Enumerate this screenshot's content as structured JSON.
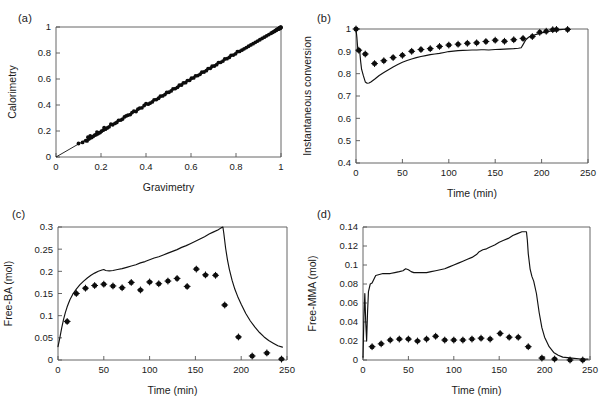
{
  "figure": {
    "background": "#ffffff",
    "line_color": "#111111",
    "marker_color": "#0d0d0d",
    "axis_color": "#555555"
  },
  "panels": {
    "a": {
      "label": "(a)"
    },
    "b": {
      "label": "(b)"
    },
    "c": {
      "label": "(c)"
    },
    "d": {
      "label": "(d)"
    }
  },
  "chart_data": [
    {
      "id": "panel-a",
      "type": "scatter",
      "title": "(a)",
      "xlabel": "Gravimetry",
      "ylabel": "Calorimetry",
      "xlim": [
        0,
        1
      ],
      "ylim": [
        0,
        1
      ],
      "xticks": [
        0,
        0.2,
        0.4,
        0.6,
        0.8,
        1
      ],
      "xticklabels": [
        "0",
        "0.2",
        "0.4",
        "0.6",
        "0.8",
        "1"
      ],
      "yticks": [
        0,
        0.2,
        0.4,
        0.6,
        0.8,
        1
      ],
      "yticklabels": [
        "0",
        "0.2",
        "0.4",
        "0.6",
        "0.8",
        "1"
      ],
      "grid": false,
      "legend": "none",
      "series": [
        {
          "name": "identity line",
          "type": "line",
          "x": [
            0,
            1
          ],
          "y": [
            0,
            1
          ]
        },
        {
          "name": "calorimetry vs gravimetry",
          "type": "scatter",
          "x": [
            0.1,
            0.118,
            0.132,
            0.138,
            0.142,
            0.146,
            0.15,
            0.152,
            0.158,
            0.165,
            0.172,
            0.178,
            0.182,
            0.186,
            0.19,
            0.196,
            0.202,
            0.21,
            0.214,
            0.22,
            0.228,
            0.236,
            0.244,
            0.252,
            0.262,
            0.27,
            0.278,
            0.288,
            0.296,
            0.304,
            0.312,
            0.32,
            0.33,
            0.338,
            0.346,
            0.356,
            0.364,
            0.372,
            0.382,
            0.392,
            0.4,
            0.41,
            0.418,
            0.428,
            0.436,
            0.446,
            0.456,
            0.464,
            0.474,
            0.484,
            0.492,
            0.502,
            0.512,
            0.52,
            0.53,
            0.54,
            0.548,
            0.558,
            0.566,
            0.576,
            0.584,
            0.594,
            0.602,
            0.612,
            0.62,
            0.63,
            0.64,
            0.648,
            0.658,
            0.668,
            0.676,
            0.686,
            0.694,
            0.704,
            0.714,
            0.722,
            0.732,
            0.742,
            0.75,
            0.76,
            0.77,
            0.778,
            0.788,
            0.798,
            0.806,
            0.816,
            0.826,
            0.836,
            0.846,
            0.856,
            0.866,
            0.876,
            0.886,
            0.896,
            0.906,
            0.916,
            0.926,
            0.936,
            0.946,
            0.956,
            0.962,
            0.968,
            0.972,
            0.976,
            0.98,
            0.982,
            0.984,
            0.986,
            0.988,
            0.99,
            0.991,
            0.992,
            0.993,
            0.994,
            0.995,
            0.996,
            0.997,
            0.998,
            0.999,
            1.0
          ],
          "y": [
            0.104,
            0.112,
            0.126,
            0.124,
            0.152,
            0.138,
            0.146,
            0.162,
            0.15,
            0.158,
            0.168,
            0.172,
            0.192,
            0.178,
            0.186,
            0.188,
            0.198,
            0.206,
            0.226,
            0.214,
            0.224,
            0.232,
            0.252,
            0.248,
            0.258,
            0.266,
            0.282,
            0.284,
            0.292,
            0.308,
            0.316,
            0.322,
            0.326,
            0.342,
            0.352,
            0.35,
            0.368,
            0.376,
            0.378,
            0.396,
            0.41,
            0.406,
            0.414,
            0.424,
            0.44,
            0.442,
            0.452,
            0.468,
            0.47,
            0.48,
            0.496,
            0.498,
            0.508,
            0.524,
            0.526,
            0.536,
            0.552,
            0.554,
            0.57,
            0.572,
            0.588,
            0.59,
            0.606,
            0.608,
            0.624,
            0.626,
            0.636,
            0.652,
            0.654,
            0.664,
            0.68,
            0.682,
            0.698,
            0.7,
            0.71,
            0.726,
            0.728,
            0.738,
            0.754,
            0.756,
            0.766,
            0.782,
            0.784,
            0.794,
            0.81,
            0.812,
            0.822,
            0.832,
            0.842,
            0.852,
            0.862,
            0.872,
            0.882,
            0.892,
            0.902,
            0.912,
            0.922,
            0.932,
            0.942,
            0.952,
            0.958,
            0.964,
            0.968,
            0.974,
            0.976,
            0.98,
            0.982,
            0.984,
            0.986,
            0.988,
            0.986,
            0.99,
            0.992,
            0.988,
            0.994,
            0.992,
            0.996,
            0.994,
            0.998,
            0.996
          ]
        }
      ]
    },
    {
      "id": "panel-b",
      "type": "line",
      "title": "(b)",
      "xlabel": "Time (min)",
      "ylabel": "Instantaneous conversion",
      "xlim": [
        0,
        250
      ],
      "ylim": [
        0.4,
        1.0
      ],
      "xticks": [
        0,
        50,
        100,
        150,
        200,
        250
      ],
      "xticklabels": [
        "0",
        "50",
        "100",
        "150",
        "200",
        "250"
      ],
      "yticks": [
        0.4,
        0.5,
        0.6,
        0.7,
        0.8,
        0.9,
        1.0
      ],
      "yticklabels": [
        "0.4",
        "0.5",
        "0.6",
        "0.7",
        "0.8",
        "0.9",
        "1"
      ],
      "grid": false,
      "legend": "none",
      "series": [
        {
          "name": "model",
          "type": "line",
          "x": [
            0,
            1,
            2,
            3,
            4,
            5,
            6,
            8,
            10,
            12,
            14,
            16,
            20,
            25,
            30,
            35,
            40,
            45,
            50,
            55,
            60,
            65,
            70,
            75,
            80,
            85,
            90,
            95,
            100,
            105,
            110,
            115,
            120,
            125,
            130,
            135,
            138,
            143,
            150,
            155,
            160,
            165,
            170,
            175,
            178,
            180,
            183,
            186,
            190,
            195,
            200,
            205,
            210,
            215,
            220,
            225,
            230
          ],
          "y": [
            1.0,
            0.96,
            0.905,
            0.9,
            0.9,
            0.855,
            0.82,
            0.79,
            0.763,
            0.757,
            0.758,
            0.763,
            0.775,
            0.792,
            0.805,
            0.818,
            0.83,
            0.841,
            0.851,
            0.859,
            0.866,
            0.872,
            0.877,
            0.881,
            0.885,
            0.888,
            0.891,
            0.895,
            0.899,
            0.901,
            0.903,
            0.904,
            0.905,
            0.906,
            0.906,
            0.907,
            0.907,
            0.906,
            0.908,
            0.909,
            0.91,
            0.911,
            0.912,
            0.914,
            0.916,
            0.93,
            0.952,
            0.963,
            0.97,
            0.977,
            0.982,
            0.987,
            0.991,
            0.994,
            0.997,
            0.999,
            1.0
          ]
        },
        {
          "name": "experimental",
          "type": "scatter",
          "x": [
            0,
            3,
            10,
            20,
            30,
            40,
            50,
            60,
            70,
            80,
            90,
            100,
            110,
            120,
            130,
            140,
            150,
            160,
            170,
            180,
            190,
            198,
            205,
            212,
            216,
            228
          ],
          "y": [
            1.0,
            0.905,
            0.888,
            0.845,
            0.858,
            0.872,
            0.882,
            0.9,
            0.908,
            0.912,
            0.922,
            0.928,
            0.932,
            0.936,
            0.938,
            0.944,
            0.95,
            0.945,
            0.952,
            0.958,
            0.966,
            0.985,
            0.99,
            0.997,
            0.998,
            0.998
          ]
        }
      ]
    },
    {
      "id": "panel-c",
      "type": "line",
      "title": "(c)",
      "xlabel": "Time (min)",
      "ylabel": "Free-BA (mol)",
      "xlim": [
        0,
        250
      ],
      "ylim": [
        0,
        0.3
      ],
      "xticks": [
        0,
        50,
        100,
        150,
        200,
        250
      ],
      "xticklabels": [
        "0",
        "50",
        "100",
        "150",
        "200",
        "250"
      ],
      "yticks": [
        0,
        0.05,
        0.1,
        0.15,
        0.2,
        0.25,
        0.3
      ],
      "yticklabels": [
        "0",
        "0.05",
        "0.1",
        "0.15",
        "0.2",
        "0.25",
        "0.3"
      ],
      "grid": false,
      "legend": "none",
      "series": [
        {
          "name": "model",
          "type": "line",
          "x": [
            0,
            2,
            4,
            6,
            8,
            10,
            13,
            16,
            20,
            24,
            28,
            32,
            36,
            40,
            44,
            48,
            50,
            52,
            56,
            60,
            65,
            70,
            75,
            80,
            85,
            90,
            95,
            100,
            105,
            110,
            115,
            120,
            125,
            130,
            135,
            140,
            145,
            150,
            155,
            160,
            165,
            170,
            175,
            178,
            180,
            181,
            183,
            185,
            187,
            190,
            193,
            196,
            200,
            205,
            210,
            215,
            220,
            225,
            230,
            235,
            240,
            245
          ],
          "y": [
            0.03,
            0.05,
            0.072,
            0.091,
            0.107,
            0.12,
            0.136,
            0.148,
            0.16,
            0.17,
            0.178,
            0.185,
            0.191,
            0.196,
            0.2,
            0.203,
            0.204,
            0.202,
            0.201,
            0.202,
            0.204,
            0.206,
            0.209,
            0.212,
            0.215,
            0.219,
            0.222,
            0.226,
            0.23,
            0.233,
            0.237,
            0.241,
            0.245,
            0.249,
            0.254,
            0.258,
            0.263,
            0.268,
            0.273,
            0.278,
            0.284,
            0.289,
            0.294,
            0.298,
            0.3,
            0.286,
            0.252,
            0.226,
            0.205,
            0.18,
            0.16,
            0.144,
            0.126,
            0.105,
            0.088,
            0.074,
            0.062,
            0.052,
            0.044,
            0.038,
            0.032,
            0.029
          ]
        },
        {
          "name": "experimental",
          "type": "scatter",
          "x": [
            10,
            20,
            30,
            40,
            50,
            60,
            70,
            80,
            90,
            100,
            110,
            120,
            130,
            141,
            151,
            161,
            172,
            182,
            197,
            212,
            228,
            244
          ],
          "y": [
            0.087,
            0.15,
            0.162,
            0.168,
            0.171,
            0.167,
            0.163,
            0.175,
            0.158,
            0.176,
            0.172,
            0.178,
            0.184,
            0.166,
            0.205,
            0.192,
            0.191,
            0.124,
            0.052,
            0.009,
            0.016,
            0.002
          ]
        }
      ]
    },
    {
      "id": "panel-d",
      "type": "line",
      "title": "(d)",
      "xlabel": "Time (min)",
      "ylabel": "Free-MMA (mol)",
      "xlim": [
        0,
        250
      ],
      "ylim": [
        0,
        0.14
      ],
      "xticks": [
        0,
        50,
        100,
        150,
        200,
        250
      ],
      "xticklabels": [
        "0",
        "50",
        "100",
        "150",
        "200",
        "250"
      ],
      "yticks": [
        0,
        0.02,
        0.04,
        0.06,
        0.08,
        0.1,
        0.12,
        0.14
      ],
      "yticklabels": [
        "0",
        "0.02",
        "0.04",
        "0.06",
        "0.08",
        "0.1",
        "0.12",
        "0.14"
      ],
      "grid": false,
      "legend": "none",
      "series": [
        {
          "name": "model",
          "type": "line",
          "x": [
            0,
            1,
            2,
            3,
            4,
            5,
            6,
            8,
            10,
            14,
            18,
            22,
            26,
            30,
            35,
            40,
            44,
            47,
            50,
            53,
            56,
            60,
            65,
            70,
            75,
            80,
            85,
            90,
            95,
            100,
            105,
            110,
            115,
            120,
            125,
            128,
            132,
            136,
            140,
            145,
            150,
            155,
            160,
            165,
            170,
            175,
            178,
            180,
            181,
            182,
            184,
            186,
            188,
            191,
            194,
            197,
            200,
            205,
            210,
            215,
            220,
            230,
            240,
            248
          ],
          "y": [
            0.003,
            0.045,
            0.07,
            0.04,
            0.02,
            0.05,
            0.072,
            0.08,
            0.081,
            0.089,
            0.09,
            0.091,
            0.091,
            0.091,
            0.092,
            0.093,
            0.094,
            0.096,
            0.095,
            0.093,
            0.092,
            0.092,
            0.092,
            0.092,
            0.093,
            0.094,
            0.095,
            0.096,
            0.098,
            0.1,
            0.102,
            0.104,
            0.106,
            0.108,
            0.111,
            0.114,
            0.116,
            0.117,
            0.119,
            0.121,
            0.124,
            0.126,
            0.128,
            0.131,
            0.133,
            0.135,
            0.135,
            0.135,
            0.126,
            0.112,
            0.096,
            0.088,
            0.083,
            0.07,
            0.05,
            0.034,
            0.024,
            0.014,
            0.008,
            0.005,
            0.003,
            0.002,
            0.001,
            0.001
          ]
        },
        {
          "name": "experimental",
          "type": "scatter",
          "x": [
            10,
            20,
            30,
            40,
            50,
            60,
            70,
            80,
            90,
            100,
            110,
            120,
            130,
            140,
            151,
            161,
            171,
            182,
            197,
            211,
            228,
            242
          ],
          "y": [
            0.014,
            0.017,
            0.021,
            0.022,
            0.022,
            0.02,
            0.022,
            0.025,
            0.021,
            0.021,
            0.021,
            0.022,
            0.023,
            0.022,
            0.028,
            0.024,
            0.024,
            0.014,
            0.002,
            0.001,
            0.0,
            0.0
          ]
        }
      ]
    }
  ]
}
